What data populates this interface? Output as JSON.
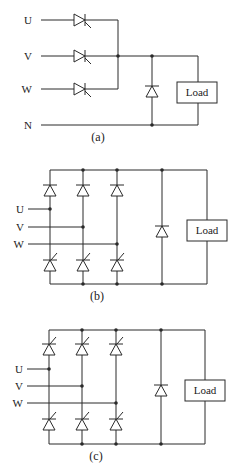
{
  "figure": {
    "background": "#ffffff",
    "line_color": "#2a2a2a",
    "panels": [
      {
        "id": "a",
        "caption": "(a)",
        "inputs": [
          "U",
          "V",
          "W",
          "N"
        ],
        "load_label": "Load",
        "devices": "three thyristors (one per phase) to common bus, free-wheeling diode across load, return via neutral N"
      },
      {
        "id": "b",
        "caption": "(b)",
        "inputs": [
          "U",
          "V",
          "W"
        ],
        "load_label": "Load",
        "devices": "half-controlled bridge: 3 upper diodes, 3 lower thyristors, free-wheeling diode across load"
      },
      {
        "id": "c",
        "caption": "(c)",
        "inputs": [
          "U",
          "V",
          "W"
        ],
        "load_label": "Load",
        "devices": "fully-controlled bridge: 6 thyristors, free-wheeling diode across load"
      }
    ]
  }
}
